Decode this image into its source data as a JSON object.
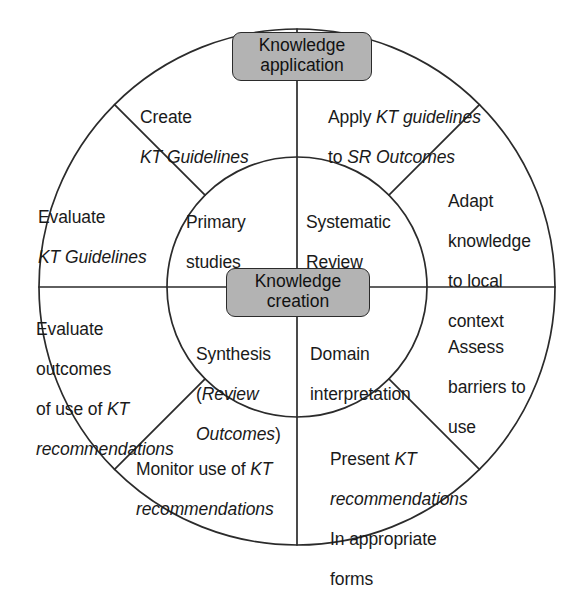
{
  "diagram": {
    "type": "concentric-wheel",
    "colors": {
      "stroke": "#2b2b2b",
      "badge_fill": "#b3b3b3",
      "badge_border": "#2b2b2b",
      "background": "#ffffff",
      "text": "#1a1a1a"
    },
    "badges": [
      {
        "id": "knowledge-application",
        "line1": "Knowledge",
        "line2": "application"
      },
      {
        "id": "knowledge-creation",
        "line1": "Knowledge",
        "line2": "creation"
      }
    ],
    "inner_circle": {
      "label": "Knowledge creation core",
      "quadrants": [
        {
          "id": "primary-studies",
          "position": "top-left",
          "line1": "Primary",
          "line2": "studies"
        },
        {
          "id": "systematic-review",
          "position": "top-right",
          "line1": "Systematic",
          "line2": "Review"
        },
        {
          "id": "synthesis",
          "position": "bottom-left",
          "line1": "Synthesis",
          "line2_regular_open": "(",
          "line2_italic": "Review",
          "line3_italic": "Outcomes",
          "line3_regular_close": ")"
        },
        {
          "id": "domain-interpretation",
          "position": "bottom-right",
          "line1": "Domain",
          "line2": "interpretation"
        }
      ]
    },
    "outer_ring": {
      "label": "Knowledge application ring",
      "sectors": [
        {
          "id": "create-kt-guidelines",
          "position": "top-left-upper",
          "line1_regular": "Create",
          "line2_italic": "KT Guidelines"
        },
        {
          "id": "apply-kt-guidelines",
          "position": "top-right-upper",
          "line1_regular": "Apply ",
          "line1_italic": "KT guidelines",
          "line2_regular": "to ",
          "line2_italic": "SR Outcomes"
        },
        {
          "id": "evaluate-kt-guidelines",
          "position": "left-upper",
          "line1_regular": "Evaluate",
          "line2_italic": "KT Guidelines"
        },
        {
          "id": "adapt-knowledge",
          "position": "right-upper",
          "line1_regular": "Adapt",
          "line2_regular": "knowledge",
          "line3_regular": "to local",
          "line4_regular": "context"
        },
        {
          "id": "evaluate-outcomes",
          "position": "left-lower",
          "line1_regular": "Evaluate",
          "line2_regular": "outcomes",
          "line3_regular": "of use of ",
          "line3_italic": "KT",
          "line4_italic": "recommendations"
        },
        {
          "id": "assess-barriers",
          "position": "right-lower",
          "line1_regular": "Assess",
          "line2_regular": "barriers to",
          "line3_regular": "use"
        },
        {
          "id": "monitor-use",
          "position": "bottom-left-lower",
          "line1_regular": "Monitor use of ",
          "line1_italic": "KT",
          "line2_italic": "recommendations"
        },
        {
          "id": "present-kt",
          "position": "bottom-right-lower",
          "line1_regular": "Present ",
          "line1_italic": "KT",
          "line2_italic": "recommendations",
          "line3_regular": "In appropriate",
          "line4_regular": "forms"
        }
      ]
    }
  }
}
